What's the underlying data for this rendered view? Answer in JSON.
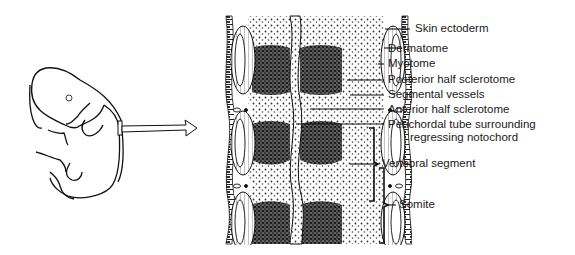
{
  "figure": {
    "type": "anatomical-diagram",
    "left_panel": {
      "subject": "embryo",
      "inset_marker": "rectangle on dorsal side",
      "arrow": "right-pointing hollow arrow to magnified view"
    },
    "right_panel": {
      "subject": "longitudinal section of somites around notochord"
    }
  },
  "labels": [
    {
      "id": "skin-ectoderm",
      "text": "Skin ectoderm"
    },
    {
      "id": "dermatome",
      "text": "Dermatome"
    },
    {
      "id": "myotome",
      "text": "Myotome"
    },
    {
      "id": "posterior-half-sclerotome",
      "text": "Posterior half sclerotome"
    },
    {
      "id": "segmental-vessels",
      "text": "Segmental vessels"
    },
    {
      "id": "anterior-half-sclerotome",
      "text": "Anterior half sclerotome"
    },
    {
      "id": "perichordal-tube",
      "text": "Perichordal tube surrounding",
      "text2": "regressing notochord"
    },
    {
      "id": "vertebral-segment",
      "text": "Vertebral segment"
    },
    {
      "id": "somite",
      "text": "Somite"
    }
  ]
}
